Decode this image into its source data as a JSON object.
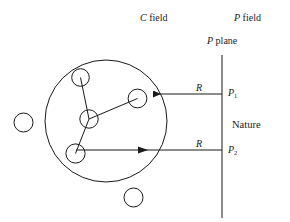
{
  "figure": {
    "stroke_color": "#1a1a1a",
    "background": "#ffffff"
  },
  "labels": {
    "c_field_italic": "C",
    "c_field_text": " field",
    "p_field_italic": "P",
    "p_field_text": " field",
    "p_plane_italic": "P",
    "p_plane_text": " plane",
    "r_top": "R",
    "r_bottom": "R",
    "p1_base": "P",
    "p1_sub": "1",
    "p2_base": "P",
    "p2_sub": "2",
    "nature": "Nature"
  },
  "geometry": {
    "big_circle": {
      "cx": 106,
      "cy": 121,
      "r": 61
    },
    "inner_nodes": [
      {
        "name": "node-top",
        "cx": 80.5,
        "cy": 77.5,
        "r": 8.8
      },
      {
        "name": "node-center",
        "cx": 89,
        "cy": 119,
        "r": 9.2
      },
      {
        "name": "node-right",
        "cx": 137.5,
        "cy": 98.5,
        "r": 9.4
      },
      {
        "name": "node-bottom-left",
        "cx": 75.5,
        "cy": 153.5,
        "r": 9.6
      }
    ],
    "outer_nodes": [
      {
        "name": "node-outer-left",
        "cx": 23.5,
        "cy": 122.5,
        "r": 9.5
      },
      {
        "name": "node-outer-bottom",
        "cx": 133.5,
        "cy": 197.5,
        "r": 9.5
      }
    ],
    "p_plane_line": {
      "x": 222,
      "y1": 55,
      "y2": 218
    },
    "arrow_top": {
      "x_from": 222,
      "x_to": 153,
      "y": 94,
      "direction": "left"
    },
    "arrow_bottom": {
      "x_from": 76,
      "x_to": 222,
      "y": 150,
      "direction": "right"
    }
  }
}
